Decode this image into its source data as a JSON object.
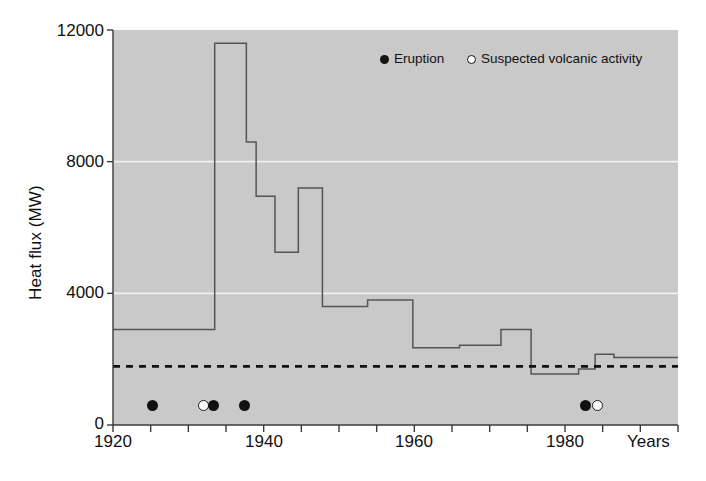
{
  "chart_data": {
    "type": "line",
    "subtype": "step",
    "title": "",
    "xlabel": "Years",
    "ylabel": "Heat flux (MW)",
    "xlim": [
      1920,
      1995
    ],
    "ylim": [
      0,
      12000
    ],
    "yticks": [
      0,
      4000,
      8000,
      12000
    ],
    "ytick_labels": [
      "0",
      "4000",
      "8000",
      "12000"
    ],
    "xticks": [
      1920,
      1925,
      1930,
      1935,
      1940,
      1945,
      1950,
      1955,
      1960,
      1965,
      1970,
      1975,
      1980,
      1985,
      1990,
      1995
    ],
    "xtick_labels_shown": [
      "1920",
      "1940",
      "1960",
      "1980"
    ],
    "xtick_labels_shown_values": [
      1920,
      1940,
      1960,
      1980
    ],
    "grid": "horizontal white gridlines at 4000 and 8000",
    "legend_position": "top-right inside plot",
    "plot_background": "#c9c9c9",
    "series": [
      {
        "name": "Heat flux step series",
        "style": "step",
        "color": "#555555",
        "steps": [
          {
            "x_start": 1920,
            "x_end": 1933.5,
            "y": 2900
          },
          {
            "x_start": 1933.5,
            "x_end": 1937.7,
            "y": 11600
          },
          {
            "x_start": 1937.7,
            "x_end": 1939.0,
            "y": 8600
          },
          {
            "x_start": 1939.0,
            "x_end": 1941.5,
            "y": 6950
          },
          {
            "x_start": 1941.5,
            "x_end": 1944.6,
            "y": 5250
          },
          {
            "x_start": 1944.6,
            "x_end": 1947.8,
            "y": 7200
          },
          {
            "x_start": 1947.8,
            "x_end": 1953.8,
            "y": 3600
          },
          {
            "x_start": 1953.8,
            "x_end": 1959.8,
            "y": 3800
          },
          {
            "x_start": 1959.8,
            "x_end": 1966.0,
            "y": 2350
          },
          {
            "x_start": 1966.0,
            "x_end": 1971.5,
            "y": 2420
          },
          {
            "x_start": 1971.5,
            "x_end": 1975.5,
            "y": 2900
          },
          {
            "x_start": 1975.5,
            "x_end": 1981.8,
            "y": 1550
          },
          {
            "x_start": 1981.8,
            "x_end": 1984.0,
            "y": 1700
          },
          {
            "x_start": 1984.0,
            "x_end": 1986.5,
            "y": 2150
          },
          {
            "x_start": 1986.5,
            "x_end": 1995,
            "y": 2050
          }
        ]
      },
      {
        "name": "Mean / baseline level",
        "style": "dashed-horizontal",
        "color": "#111111",
        "y": 1780,
        "x_start": 1920,
        "x_end": 1995
      }
    ],
    "events": [
      {
        "type": "eruption",
        "year": 1925.2,
        "marker": "filled"
      },
      {
        "type": "suspected",
        "year": 1932.0,
        "marker": "open"
      },
      {
        "type": "eruption",
        "year": 1933.3,
        "marker": "filled"
      },
      {
        "type": "eruption",
        "year": 1937.4,
        "marker": "filled"
      },
      {
        "type": "eruption",
        "year": 1982.7,
        "marker": "filled"
      },
      {
        "type": "suspected",
        "year": 1984.3,
        "marker": "open"
      }
    ]
  },
  "axes": {
    "y_axis_title": "Heat flux (MW)",
    "x_axis_title": "Years",
    "y_tick_0": "0",
    "y_tick_4000": "4000",
    "y_tick_8000": "8000",
    "y_tick_12000": "12000",
    "x_tick_1920": "1920",
    "x_tick_1940": "1940",
    "x_tick_1960": "1960",
    "x_tick_1980": "1980"
  },
  "legend": {
    "items": [
      {
        "label": "Eruption",
        "marker": "filled-circle"
      },
      {
        "label": "Suspected volcanic activity",
        "marker": "open-circle"
      }
    ],
    "eruption_label": "Eruption",
    "suspected_label": "Suspected volcanic activity"
  },
  "colors": {
    "plot_background": "#c9c9c9",
    "page_background": "#ffffff",
    "line": "#555555",
    "baseline": "#111111",
    "gridline": "#f0f0f0",
    "text": "#111111"
  }
}
